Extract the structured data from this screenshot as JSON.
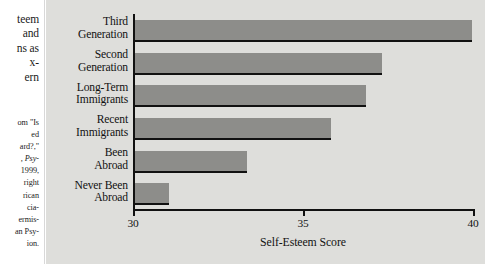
{
  "margin": {
    "caption_lines": [
      "teem",
      "and",
      "ns as",
      "x-",
      "ern"
    ],
    "source_lines": [
      "om \"Is",
      "ed",
      "ard?,\"",
      ", Psy-",
      "1999,",
      "right",
      "rican",
      "cia-",
      "ermis-",
      "an Psy-",
      "ion."
    ]
  },
  "chart_data": {
    "type": "bar",
    "orientation": "horizontal",
    "title": "",
    "xlabel": "Self-Esteem Score",
    "ylabel": "",
    "xlim": [
      30,
      40
    ],
    "xticks": [
      30,
      35,
      40
    ],
    "xtick_labels": [
      "30",
      "35",
      "40"
    ],
    "grid": false,
    "legend": null,
    "bar_color": "#8d8d8a",
    "bar_edge_color": "#111111",
    "background_color": "#dededb",
    "categories": [
      "Third Generation",
      "Second Generation",
      "Long-Term Immigrants",
      "Recent Immigrants",
      "Been Abroad",
      "Never Been Abroad"
    ],
    "category_label_lines": [
      [
        "Third",
        "Generation"
      ],
      [
        "Second",
        "Generation"
      ],
      [
        "Long-Term",
        "Immigrants"
      ],
      [
        "Recent",
        "Immigrants"
      ],
      [
        "Been",
        "Abroad"
      ],
      [
        "Never Been",
        "Abroad"
      ]
    ],
    "values": [
      39.9,
      37.25,
      36.8,
      35.75,
      33.3,
      31.0
    ]
  }
}
